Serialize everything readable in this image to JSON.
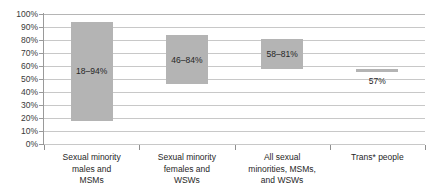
{
  "chart_data": {
    "type": "bar",
    "chart_style": "floating-range-bar",
    "title": "",
    "subtitle": "",
    "xlabel": "",
    "ylabel": "",
    "ylim": [
      0,
      100
    ],
    "yunit": "%",
    "ytick_labels": [
      "100%",
      "90%",
      "80%",
      "70%",
      "60%",
      "50%",
      "40%",
      "30%",
      "20%",
      "10%",
      "0%"
    ],
    "ytick_values": [
      100,
      90,
      80,
      70,
      60,
      50,
      40,
      30,
      20,
      10,
      0
    ],
    "grid": true,
    "legend": false,
    "categories": [
      "Sexual minority males and MSMs",
      "Sexual minority females and WSWs",
      "All sexual minorities, MSMs, and WSWs",
      "Trans* people"
    ],
    "category_lines": [
      [
        "Sexual minority",
        "males and",
        "MSMs"
      ],
      [
        "Sexual minority",
        "females and",
        "WSWs"
      ],
      [
        "All sexual",
        "minorities, MSMs,",
        "and WSWs"
      ],
      [
        "Trans* people"
      ]
    ],
    "bars": [
      {
        "category": "Sexual minority males and MSMs",
        "low": 18,
        "high": 94,
        "label": "18–94%"
      },
      {
        "category": "Sexual minority females and WSWs",
        "low": 46,
        "high": 84,
        "label": "46–84%"
      },
      {
        "category": "All sexual minorities, MSMs, and WSWs",
        "low": 58,
        "high": 81,
        "label": "58–81%"
      },
      {
        "category": "Trans* people",
        "low": 57,
        "high": 57,
        "label": "57%"
      }
    ],
    "bar_color": "#b4b4b4",
    "gridline_color": "#c8c8c8",
    "axis_color": "#8f8f8f",
    "text_color": "#262626"
  }
}
